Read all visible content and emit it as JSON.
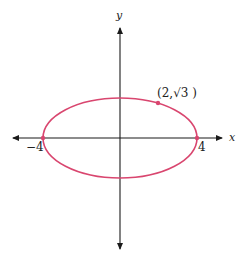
{
  "diagram": {
    "type": "ellipse-graph",
    "x_axis_label": "x",
    "y_axis_label": "y",
    "tick_labels": {
      "left_vertex": "−4",
      "right_vertex": "4"
    },
    "point_label": "(2,√3 )",
    "ellipse": {
      "center": [
        0,
        0
      ],
      "semi_major_x": 4,
      "semi_minor_y": 2,
      "equation": "x^2/16 + y^2/4 = 1"
    },
    "marked_points": [
      {
        "x": -4,
        "y": 0
      },
      {
        "x": 4,
        "y": 0
      },
      {
        "x": 2,
        "y": 1.732
      }
    ],
    "colors": {
      "ellipse": "#d9466f",
      "axes": "#1a1a1a",
      "text": "#222222"
    }
  }
}
